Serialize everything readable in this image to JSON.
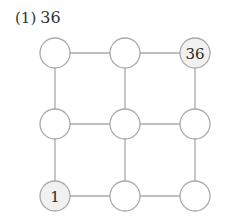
{
  "title": {
    "label": "(1)",
    "number": "36"
  },
  "grid": {
    "rows": 3,
    "cols": 3,
    "nodes": [
      {
        "row": 0,
        "col": 0,
        "label": "",
        "filled": false
      },
      {
        "row": 0,
        "col": 1,
        "label": "",
        "filled": false
      },
      {
        "row": 0,
        "col": 2,
        "label": "36",
        "filled": true
      },
      {
        "row": 1,
        "col": 0,
        "label": "",
        "filled": false
      },
      {
        "row": 1,
        "col": 1,
        "label": "",
        "filled": false
      },
      {
        "row": 1,
        "col": 2,
        "label": "",
        "filled": false
      },
      {
        "row": 2,
        "col": 0,
        "label": "1",
        "filled": true
      },
      {
        "row": 2,
        "col": 1,
        "label": "",
        "filled": false
      },
      {
        "row": 2,
        "col": 2,
        "label": "",
        "filled": false
      }
    ]
  },
  "colors": {
    "line": "#a9a9a9",
    "filled_node": "#f1f1f1",
    "text": "#2a2a2a"
  }
}
